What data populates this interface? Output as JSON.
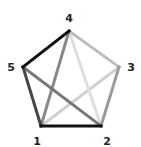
{
  "diagram": {
    "type": "complete-graph",
    "title": "",
    "vertices": [
      {
        "id": "1",
        "label": "1",
        "x": 41,
        "y": 126,
        "label_x": 37,
        "label_y": 141
      },
      {
        "id": "2",
        "label": "2",
        "x": 101,
        "label_x": 107,
        "y": 126,
        "label_y": 141
      },
      {
        "id": "3",
        "label": "3",
        "x": 119,
        "y": 67,
        "label_x": 131,
        "label_y": 67
      },
      {
        "id": "4",
        "label": "4",
        "x": 69,
        "y": 31,
        "label_x": 69,
        "label_y": 18
      },
      {
        "id": "5",
        "label": "5",
        "x": 23,
        "y": 67,
        "label_x": 11,
        "label_y": 67
      }
    ],
    "edges": [
      {
        "from": "3",
        "to": "1",
        "color": "#cfcfcf"
      },
      {
        "from": "4",
        "to": "2",
        "color": "#dedede"
      },
      {
        "from": "4",
        "to": "3",
        "color": "#bdbdbd"
      },
      {
        "from": "3",
        "to": "2",
        "color": "#9a9a9a"
      },
      {
        "from": "4",
        "to": "1",
        "color": "#888888"
      },
      {
        "from": "5",
        "to": "2",
        "color": "#777777"
      },
      {
        "from": "1",
        "to": "5",
        "color": "#444444"
      },
      {
        "from": "4",
        "to": "5",
        "color": "#111111"
      },
      {
        "from": "1",
        "to": "2",
        "color": "#111111"
      }
    ]
  }
}
